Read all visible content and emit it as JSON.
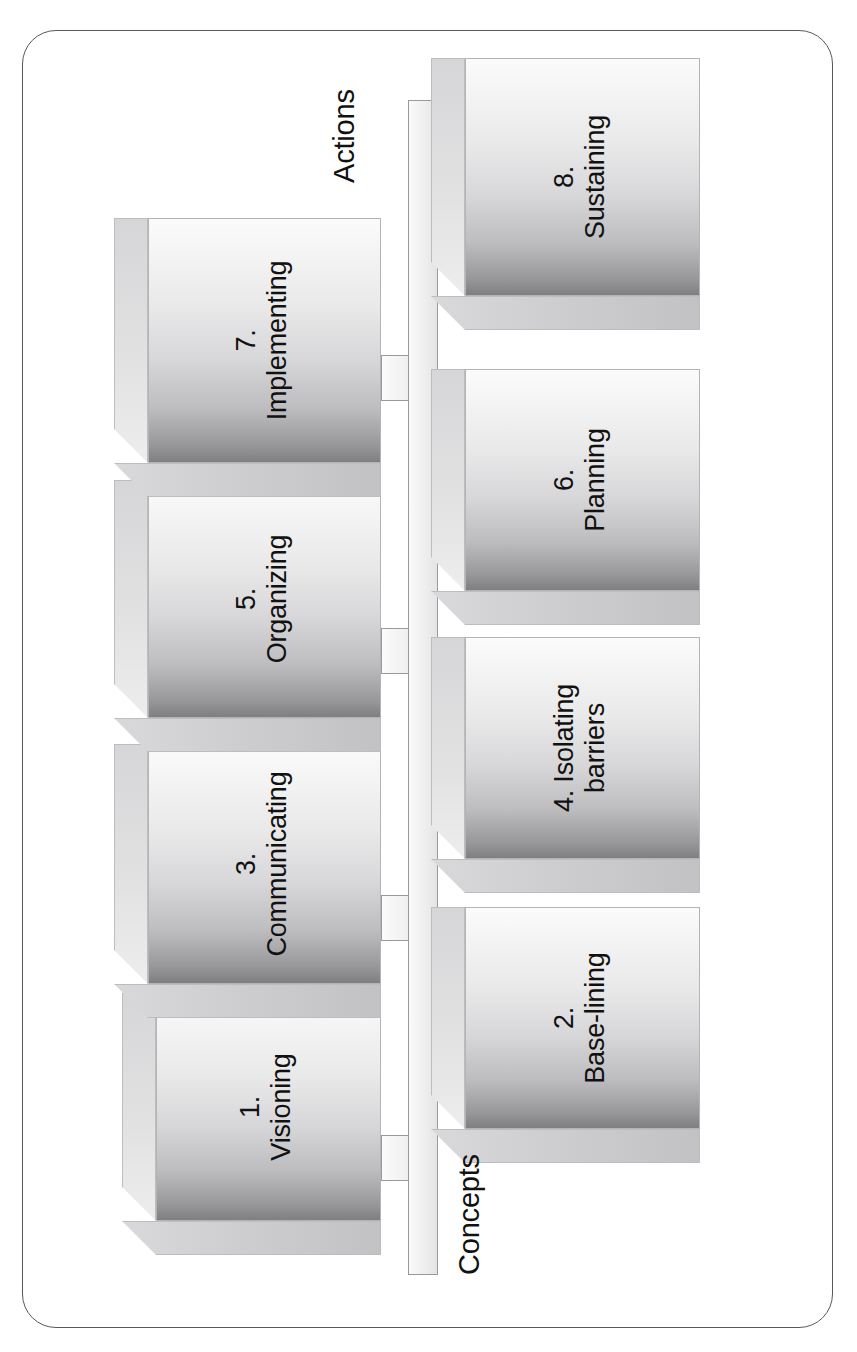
{
  "diagram": {
    "axis_labels": {
      "top": "Actions",
      "bottom": "Concepts"
    },
    "colors": {
      "frame_border": "#58585a",
      "box_front_light": "#fbfbfb",
      "box_front_dark": "#7f7f81",
      "box_top": "#e2e2e3",
      "box_side": "#cfcfd1",
      "spine_fill": "#f1f1f1",
      "spine_border": "#9a9a9c",
      "text": "#111111"
    },
    "steps": [
      {
        "number": "1.",
        "name": "Visioning",
        "row": "concepts",
        "two_line": true
      },
      {
        "number": "2.",
        "name": "Base-lining",
        "row": "actions",
        "two_line": true
      },
      {
        "number": "3.",
        "name": "Communicating",
        "row": "concepts",
        "two_line": true
      },
      {
        "number": "4.",
        "name": "Isolating barriers",
        "row": "actions",
        "two_line": true
      },
      {
        "number": "5.",
        "name": "Organizing",
        "row": "concepts",
        "two_line": true
      },
      {
        "number": "6.",
        "name": "Planning",
        "row": "actions",
        "two_line": true
      },
      {
        "number": "7.",
        "name": "Implementing",
        "row": "concepts",
        "two_line": true
      },
      {
        "number": "8.",
        "name": "Sustaining",
        "row": "actions",
        "two_line": true
      }
    ]
  }
}
